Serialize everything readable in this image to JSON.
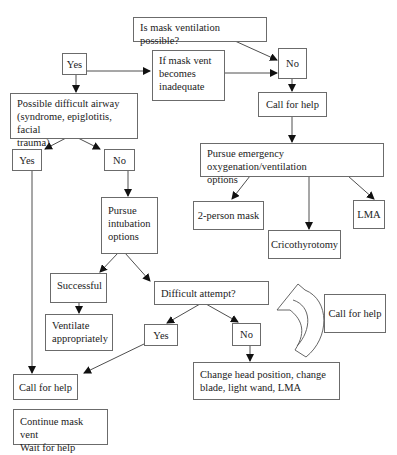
{
  "diagram": {
    "type": "flowchart",
    "nodes": {
      "q_mask": "Is mask ventilation possible?",
      "yes_top": "Yes",
      "mask_inadequate": "If mask vent\nbecomes\ninadequate",
      "no_top": "No",
      "call_help_top": "Call for help",
      "difficult_airway": "Possible difficult airway\n(syndrome, epiglotitis, facial\ntrauma)",
      "emergency_options": "Pursue emergency oxygenation/ventilation\noptions",
      "yes_left": "Yes",
      "no_left": "No",
      "intubation_options": "Pursue\nintubation\noptions",
      "two_person_mask": "2-person mask",
      "lma": "LMA",
      "cricothyrotomy": "Cricothyrotomy",
      "successful": "Successful",
      "difficult_attempt": "Difficult attempt?",
      "ventilate": "Ventilate\nappropriately",
      "yes_mid": "Yes",
      "no_mid": "No",
      "call_help_side": "Call for help",
      "change_position": "Change head position, change\nblade, light wand, LMA",
      "call_help_bottom": "Call for help",
      "continue_mask": "Continue mask vent\nWait for help"
    },
    "edges": [
      [
        "q_mask",
        "no_top"
      ],
      [
        "yes_top",
        "mask_inadequate"
      ],
      [
        "mask_inadequate",
        "no_top"
      ],
      [
        "yes_top",
        "difficult_airway"
      ],
      [
        "no_top",
        "call_help_top"
      ],
      [
        "call_help_top",
        "emergency_options"
      ],
      [
        "emergency_options",
        "two_person_mask"
      ],
      [
        "emergency_options",
        "cricothyrotomy"
      ],
      [
        "emergency_options",
        "lma"
      ],
      [
        "difficult_airway",
        "yes_left"
      ],
      [
        "difficult_airway",
        "no_left"
      ],
      [
        "no_left",
        "intubation_options"
      ],
      [
        "intubation_options",
        "successful"
      ],
      [
        "intubation_options",
        "difficult_attempt"
      ],
      [
        "successful",
        "ventilate"
      ],
      [
        "difficult_attempt",
        "yes_mid"
      ],
      [
        "difficult_attempt",
        "no_mid"
      ],
      [
        "no_mid",
        "change_position"
      ],
      [
        "yes_mid",
        "call_help_bottom"
      ],
      [
        "yes_left",
        "call_help_bottom"
      ],
      [
        "change_position",
        "difficult_attempt"
      ]
    ],
    "colors": {
      "line": "#3a3a3a",
      "border": "#6b6b6b",
      "background": "#ffffff"
    }
  }
}
